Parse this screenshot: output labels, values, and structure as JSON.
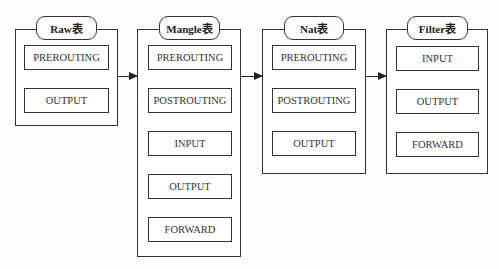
{
  "tables": [
    {
      "title": "Raw表",
      "chains": [
        "PREROUTING",
        "OUTPUT"
      ]
    },
    {
      "title": "Mangle表",
      "chains": [
        "PREROUTING",
        "POSTROUTING",
        "INPUT",
        "OUTPUT",
        "FORWARD"
      ]
    },
    {
      "title": "Nat表",
      "chains": [
        "PREROUTING",
        "POSTROUTING",
        "OUTPUT"
      ]
    },
    {
      "title": "Filter表",
      "chains": [
        "INPUT",
        "OUTPUT",
        "FORWARD"
      ]
    }
  ]
}
